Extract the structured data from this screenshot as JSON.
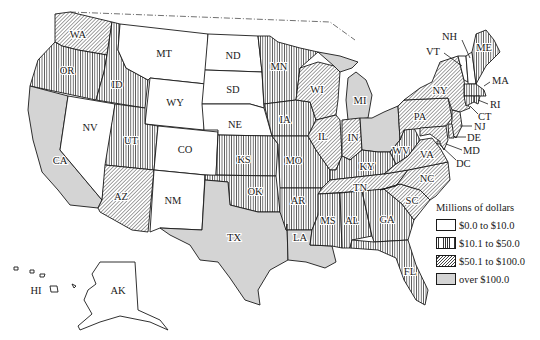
{
  "legend": {
    "title": "Millions of dollars",
    "items": [
      {
        "label": "$0.0 to $10.0",
        "pattern": "white"
      },
      {
        "label": "$10.1 to $50.0",
        "pattern": "vertical"
      },
      {
        "label": "$50.1 to $100.0",
        "pattern": "diagonal"
      },
      {
        "label": "over $100.0",
        "pattern": "gray"
      }
    ]
  },
  "colors": {
    "stroke": "#1a1a1a",
    "gray_fill": "#d4d4d4",
    "background": "#ffffff"
  },
  "states": {
    "WA": "$50.1 to $100.0",
    "OR": "$10.1 to $50.0",
    "CA": "over $100.0",
    "ID": "$10.1 to $50.0",
    "NV": "$0.0 to $10.0",
    "MT": "$0.0 to $10.0",
    "WY": "$0.0 to $10.0",
    "UT": "$10.1 to $50.0",
    "AZ": "$50.1 to $100.0",
    "CO": "$0.0 to $10.0",
    "NM": "$0.0 to $10.0",
    "ND": "$0.0 to $10.0",
    "SD": "$0.0 to $10.0",
    "NE": "$0.0 to $10.0",
    "KS": "$10.1 to $50.0",
    "OK": "$10.1 to $50.0",
    "TX": "over $100.0",
    "MN": "$10.1 to $50.0",
    "IA": "$10.1 to $50.0",
    "MO": "$10.1 to $50.0",
    "AR": "$10.1 to $50.0",
    "LA": "over $100.0",
    "WI": "$50.1 to $100.0",
    "IL": "$50.1 to $100.0",
    "MI": "over $100.0",
    "IN": "$50.1 to $100.0",
    "OH": "over $100.0",
    "KY": "$10.1 to $50.0",
    "TN": "$50.1 to $100.0",
    "MS": "$10.1 to $50.0",
    "AL": "$10.1 to $50.0",
    "GA": "$10.1 to $50.0",
    "FL": "$10.1 to $50.0",
    "SC": "$50.1 to $100.0",
    "NC": "$50.1 to $100.0",
    "VA": "$50.1 to $100.0",
    "WV": "$10.1 to $50.0",
    "PA": "$50.1 to $100.0",
    "NY": "$50.1 to $100.0",
    "VT": "$0.0 to $10.0",
    "NH": "$0.0 to $10.0",
    "ME": "$10.1 to $50.0",
    "MA": "$10.1 to $50.0",
    "RI": "$10.1 to $50.0",
    "CT": "$10.1 to $50.0",
    "NJ": "$50.1 to $100.0",
    "DE": "$50.1 to $100.0",
    "MD": "$50.1 to $100.0",
    "DC": "$50.1 to $100.0",
    "AK": "$0.0 to $10.0",
    "HI": "$0.0 to $10.0"
  },
  "labels": {
    "WA": "WA",
    "OR": "OR",
    "CA": "CA",
    "ID": "ID",
    "NV": "NV",
    "MT": "MT",
    "WY": "WY",
    "UT": "UT",
    "AZ": "AZ",
    "CO": "CO",
    "NM": "NM",
    "ND": "ND",
    "SD": "SD",
    "NE": "NE",
    "KS": "KS",
    "OK": "OK",
    "TX": "TX",
    "MN": "MN",
    "IA": "IA",
    "MO": "MO",
    "AR": "AR",
    "LA": "LA",
    "WI": "WI",
    "IL": "IL",
    "MI": "MI",
    "IN": "IN",
    "KY": "KY",
    "TN": "TN",
    "MS": "MS",
    "AL": "AL",
    "GA": "GA",
    "FL": "FL",
    "SC": "SC",
    "NC": "NC",
    "VA": "VA",
    "WV": "WV",
    "PA": "PA",
    "NY": "NY",
    "VT": "VT",
    "NH": "NH",
    "ME": "ME",
    "MA": "MA",
    "RI": "RI",
    "CT": "CT",
    "NJ": "NJ",
    "DE": "DE",
    "MD": "MD",
    "DC": "DC",
    "AK": "AK",
    "HI": "HI"
  }
}
